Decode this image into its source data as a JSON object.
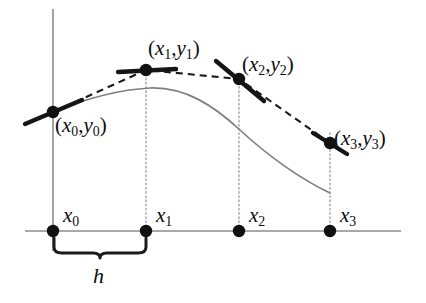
{
  "figure": {
    "kind": "math-diagram",
    "background_color": "#ffffff",
    "axis_color": "#8c8c8c",
    "curve_color": "#7f7f7f",
    "chord_color": "#1b1b1b",
    "dot_color": "#111111",
    "guide_color": "#9a9a9a"
  },
  "axes": {
    "x_axis": {
      "x1": 25,
      "x2": 401,
      "y": 231
    },
    "y_axis": {
      "x": 53,
      "y1": 9,
      "y2": 251
    }
  },
  "point_labels": [
    {
      "id": "p0",
      "text": "(x0,y0)",
      "var": "x",
      "index": "0",
      "var2": "y",
      "index2": "0"
    },
    {
      "id": "p1",
      "text": "(x1,y1)",
      "var": "x",
      "index": "1",
      "var2": "y",
      "index2": "1"
    },
    {
      "id": "p2",
      "text": "(x2,y2)",
      "var": "x",
      "index": "2",
      "var2": "y",
      "index2": "2"
    },
    {
      "id": "p3",
      "text": "(x3,y3)",
      "var": "x",
      "index": "3",
      "var2": "y",
      "index2": "3"
    }
  ],
  "tick_labels": [
    {
      "id": "t0",
      "var": "x",
      "index": "0"
    },
    {
      "id": "t1",
      "var": "x",
      "index": "1"
    },
    {
      "id": "t2",
      "var": "x",
      "index": "2"
    },
    {
      "id": "t3",
      "var": "x",
      "index": "3"
    }
  ],
  "step_label": {
    "var": "h"
  },
  "chart_data": {
    "type": "line",
    "title": "",
    "xlabel": "",
    "ylabel": "",
    "grid": false,
    "legend": null,
    "axis_origin_px": [
      53,
      231
    ],
    "xlim_px": [
      25,
      401
    ],
    "ylim_px": [
      9,
      251
    ],
    "step_h_px": 93,
    "categories": [
      "x0",
      "x1",
      "x2",
      "x3"
    ],
    "node_x_px": [
      53,
      146,
      239,
      330
    ],
    "node_axis_y_px": 231,
    "series": [
      {
        "name": "sample nodes (dashed polyline)",
        "style": "dashed",
        "points_px": [
          [
            53,
            112
          ],
          [
            146,
            70
          ],
          [
            239,
            79
          ],
          [
            330,
            143
          ]
        ]
      },
      {
        "name": "underlying smooth solution curve",
        "style": "solid",
        "points_px": [
          [
            53,
            112
          ],
          [
            100,
            95
          ],
          [
            150,
            88
          ],
          [
            200,
            100
          ],
          [
            250,
            129
          ],
          [
            295,
            162
          ],
          [
            330,
            193
          ]
        ]
      }
    ],
    "tangents_px": [
      {
        "at": "x0",
        "x1": 25,
        "y1": 124,
        "x2": 82,
        "y2": 100
      },
      {
        "at": "x1",
        "x1": 118,
        "y1": 72,
        "x2": 176,
        "y2": 69
      },
      {
        "at": "x2",
        "x1": 216,
        "y1": 61,
        "x2": 264,
        "y2": 101
      },
      {
        "at": "x3",
        "x1": 313,
        "y1": 133,
        "x2": 347,
        "y2": 154
      }
    ],
    "annotations": [
      {
        "text": "h",
        "meaning": "uniform step size between consecutive abscissas",
        "span_px": [
          53,
          146
        ],
        "y_px": 255
      }
    ]
  }
}
